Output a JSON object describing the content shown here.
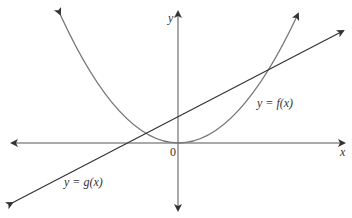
{
  "diagram": {
    "axes": {
      "x_label": "x",
      "y_label": "y",
      "origin_label": "0"
    },
    "curves": [
      {
        "name": "f",
        "label": "y = f(x)",
        "type": "parabola"
      },
      {
        "name": "g",
        "label": "y = g(x)",
        "type": "line"
      }
    ],
    "colors": {
      "curve": "#666666",
      "line": "#333333",
      "axis": "#444444"
    }
  }
}
